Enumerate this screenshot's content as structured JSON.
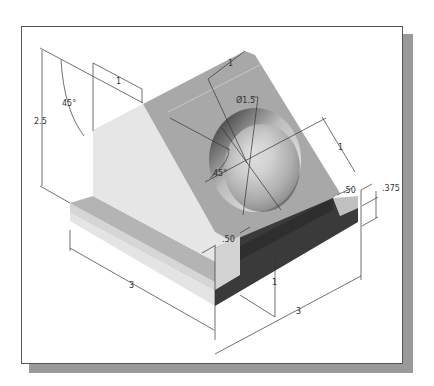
{
  "figure": {
    "type": "isometric technical drawing"
  },
  "colors": {
    "frame_border": "#555555",
    "frame_shadow": "#9a9a9a",
    "face_light": "#e6e6e6",
    "face_medium": "#b4b4b4",
    "face_slope": "#a8a8a8",
    "face_dark": "#3a3a3a",
    "dimension_line": "#333333"
  },
  "dimensions": {
    "height_overall": "2.5",
    "top_angle": "45°",
    "top_flat_width": "1",
    "hole_diameter": "Ø1.5",
    "hole_position_along_slope": "1",
    "hole_position_across": "1",
    "hole_angle": "45°",
    "slot_width_right": ".50",
    "base_thickness": ".375",
    "slot_width_left": ".50",
    "slot_depth": "1",
    "base_length_left": "3",
    "base_length_right": "3"
  }
}
